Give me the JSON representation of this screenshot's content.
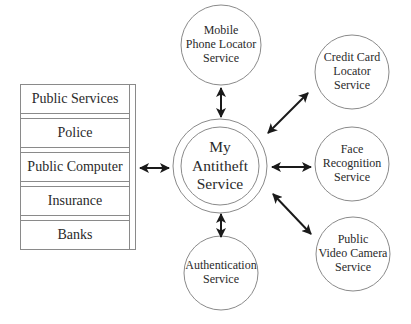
{
  "colors": {
    "stroke": "#8a8a8a",
    "arrow": "#1a1a1a",
    "text": "#2a2a2a",
    "background": "#ffffff"
  },
  "central_node": {
    "id": "my-antitheft-service",
    "lines": [
      "My",
      "Antitheft",
      "Service"
    ],
    "cx": 220,
    "cy": 166,
    "r_outer": 47,
    "r_inner": 39
  },
  "service_nodes": [
    {
      "id": "mobile-phone-locator-service",
      "lines": [
        "Mobile",
        "Phone Locator",
        "Service"
      ],
      "cx": 221,
      "cy": 45,
      "r": 40
    },
    {
      "id": "credit-card-locator-service",
      "lines": [
        "Credit Card",
        "Locator",
        "Service"
      ],
      "cx": 352,
      "cy": 72,
      "r": 37
    },
    {
      "id": "face-recognition-service",
      "lines": [
        "Face",
        "Recognition",
        "Service"
      ],
      "cx": 352,
      "cy": 164,
      "r": 37
    },
    {
      "id": "public-video-camera-service",
      "lines": [
        "Public",
        "Video Camera",
        "Service"
      ],
      "cx": 353,
      "cy": 254,
      "r": 37
    },
    {
      "id": "authentication-service",
      "lines": [
        "Authentication",
        "Service"
      ],
      "cx": 221,
      "cy": 273,
      "r": 37
    }
  ],
  "client_panel": {
    "items": [
      {
        "label": "Public Services"
      },
      {
        "label": "Police"
      },
      {
        "label": "Public Computer"
      },
      {
        "label": "Insurance"
      },
      {
        "label": "Banks"
      }
    ]
  },
  "connections": [
    {
      "from": "client-panel",
      "to": "my-antitheft-service",
      "type": "bidirectional",
      "x1": 140,
      "y1": 168,
      "x2": 169,
      "y2": 168
    },
    {
      "from": "mobile-phone-locator-service",
      "to": "my-antitheft-service",
      "type": "bidirectional",
      "x1": 221,
      "y1": 88,
      "x2": 221,
      "y2": 117
    },
    {
      "from": "credit-card-locator-service",
      "to": "my-antitheft-service",
      "type": "bidirectional",
      "x1": 308,
      "y1": 93,
      "x2": 268,
      "y2": 133
    },
    {
      "from": "face-recognition-service",
      "to": "my-antitheft-service",
      "type": "bidirectional",
      "x1": 272,
      "y1": 167,
      "x2": 311,
      "y2": 167
    },
    {
      "from": "public-video-camera-service",
      "to": "my-antitheft-service",
      "type": "bidirectional",
      "x1": 273,
      "y1": 194,
      "x2": 311,
      "y2": 234
    },
    {
      "from": "authentication-service",
      "to": "my-antitheft-service",
      "type": "bidirectional",
      "x1": 221,
      "y1": 214,
      "x2": 221,
      "y2": 237
    }
  ]
}
